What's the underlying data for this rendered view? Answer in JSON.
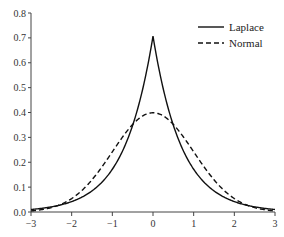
{
  "chart_data": {
    "type": "line",
    "title": "",
    "xlabel": "",
    "ylabel": "",
    "xlim": [
      -3,
      3
    ],
    "ylim": [
      0.0,
      0.8
    ],
    "grid": false,
    "legend_position": "upper right",
    "x_ticks": [
      "-3",
      "-2",
      "-1",
      "0",
      "1",
      "2",
      "3"
    ],
    "y_ticks": [
      "0.0",
      "0.1",
      "0.2",
      "0.3",
      "0.4",
      "0.5",
      "0.6",
      "0.7",
      "0.8"
    ],
    "x": [
      -3,
      -2.5,
      -2,
      -1.5,
      -1,
      -0.5,
      0,
      0.5,
      1,
      1.5,
      2,
      2.5,
      3
    ],
    "series": [
      {
        "name": "Laplace",
        "style": "solid",
        "color": "#111111",
        "values": [
          0.01,
          0.021,
          0.042,
          0.085,
          0.172,
          0.35,
          0.707,
          0.35,
          0.172,
          0.085,
          0.042,
          0.021,
          0.01
        ]
      },
      {
        "name": "Normal",
        "style": "dashed",
        "color": "#111111",
        "values": [
          0.004,
          0.018,
          0.054,
          0.13,
          0.242,
          0.352,
          0.399,
          0.352,
          0.242,
          0.13,
          0.054,
          0.018,
          0.004
        ]
      }
    ]
  },
  "legend": {
    "items": [
      {
        "label": "Laplace",
        "style": "solid"
      },
      {
        "label": "Normal",
        "style": "dashed"
      }
    ]
  }
}
